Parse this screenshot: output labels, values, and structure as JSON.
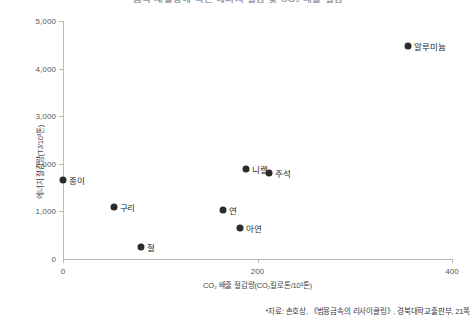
{
  "chart_data": {
    "type": "scatter",
    "title": "금속 재활용에 따른 에너지 절감 및 CO₂ 배출 절감",
    "xlabel": "CO₂ 배출 절감량(CO₂킬로톤/10³톤)",
    "ylabel": "에너지 절감량(TJ/10³톤)",
    "xlim": [
      0,
      400
    ],
    "ylim": [
      0,
      5000
    ],
    "xticks": [
      {
        "value": 0,
        "label": "0"
      },
      {
        "value": 200,
        "label": "200"
      },
      {
        "value": 400,
        "label": "400"
      }
    ],
    "yticks": [
      {
        "value": 0,
        "label": "0"
      },
      {
        "value": 1000,
        "label": "1,000"
      },
      {
        "value": 2000,
        "label": "2,000"
      },
      {
        "value": 3000,
        "label": "3,000"
      },
      {
        "value": 4000,
        "label": "4,000"
      },
      {
        "value": 5000,
        "label": "5,000"
      }
    ],
    "grid": false,
    "legend": "none",
    "point_color": "#2b2b2b",
    "points": [
      {
        "name": "종이",
        "x": 0,
        "y": 1660,
        "label_side": "right"
      },
      {
        "name": "구리",
        "x": 52,
        "y": 1090,
        "label_side": "right"
      },
      {
        "name": "철",
        "x": 80,
        "y": 250,
        "label_side": "right"
      },
      {
        "name": "연",
        "x": 165,
        "y": 1020,
        "label_side": "right"
      },
      {
        "name": "아연",
        "x": 182,
        "y": 650,
        "label_side": "right"
      },
      {
        "name": "니켈",
        "x": 188,
        "y": 1900,
        "label_side": "right"
      },
      {
        "name": "주석",
        "x": 212,
        "y": 1800,
        "label_side": "right"
      },
      {
        "name": "알루미늄",
        "x": 355,
        "y": 4480,
        "label_side": "right"
      }
    ]
  },
  "source_note": "*자료: 손호상, 《범용금속의 리사이클링》, 경북대학교출판부, 21쪽"
}
